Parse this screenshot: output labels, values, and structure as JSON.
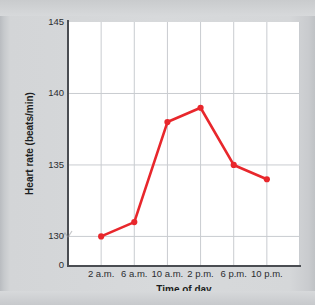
{
  "chart_data": {
    "type": "line",
    "title": "",
    "xlabel": "Time of day",
    "ylabel": "Heart rate (beats/min)",
    "categories": [
      "2 a.m.",
      "6 a.m.",
      "10 a.m.",
      "2 p.m.",
      "6 p.m.",
      "10 p.m."
    ],
    "values": [
      130,
      131,
      138,
      139,
      135,
      134
    ],
    "series": [
      {
        "name": "Heart rate",
        "values": [
          130,
          131,
          138,
          139,
          135,
          134
        ]
      }
    ],
    "ylim": [
      128,
      145
    ],
    "y_ticks": [
      "145",
      "140",
      "135",
      "130"
    ],
    "y_tick_values": [
      145,
      140,
      135,
      130
    ],
    "y_origin_label": "0",
    "y_axis_break": true,
    "grid": true,
    "legend": false,
    "legend_position": "none",
    "line_color": "#e8272c",
    "marker_color": "#e8272c",
    "marker_shape": "circle",
    "plot_background": "#ffffff",
    "figure_background": "#d7d9db",
    "gridline_color": "#c9ccd0"
  },
  "axis": {
    "y_title": "Heart rate (beats/min)",
    "x_title": "Time of day",
    "origin": "0"
  },
  "icons": {
    "axis_break": "axis-break-icon"
  }
}
